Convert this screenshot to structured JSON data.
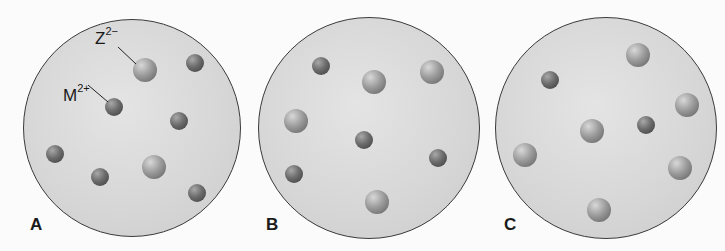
{
  "panels": [
    {
      "label": "A",
      "cx": 132,
      "cy": 128,
      "r": 109,
      "particles": [
        {
          "type": "Z2-",
          "x": 145,
          "y": 70
        },
        {
          "type": "M2+",
          "x": 195,
          "y": 63
        },
        {
          "type": "M2+",
          "x": 114,
          "y": 107
        },
        {
          "type": "M2+",
          "x": 179,
          "y": 121
        },
        {
          "type": "M2+",
          "x": 55,
          "y": 154
        },
        {
          "type": "M2+",
          "x": 100,
          "y": 177
        },
        {
          "type": "Z2-",
          "x": 154,
          "y": 167
        },
        {
          "type": "M2+",
          "x": 197,
          "y": 193
        }
      ]
    },
    {
      "label": "B",
      "cx": 369,
      "cy": 128,
      "r": 111,
      "particles": [
        {
          "type": "M2+",
          "x": 321,
          "y": 66
        },
        {
          "type": "Z2-",
          "x": 374,
          "y": 82
        },
        {
          "type": "Z2-",
          "x": 432,
          "y": 72
        },
        {
          "type": "Z2-",
          "x": 296,
          "y": 121
        },
        {
          "type": "M2+",
          "x": 364,
          "y": 140
        },
        {
          "type": "M2+",
          "x": 438,
          "y": 158
        },
        {
          "type": "M2+",
          "x": 294,
          "y": 174
        },
        {
          "type": "Z2-",
          "x": 377,
          "y": 202
        }
      ]
    },
    {
      "label": "C",
      "cx": 606,
      "cy": 128,
      "r": 111,
      "particles": [
        {
          "type": "Z2-",
          "x": 638,
          "y": 55
        },
        {
          "type": "M2+",
          "x": 550,
          "y": 80
        },
        {
          "type": "Z2-",
          "x": 687,
          "y": 105
        },
        {
          "type": "Z2-",
          "x": 592,
          "y": 131
        },
        {
          "type": "M2+",
          "x": 646,
          "y": 125
        },
        {
          "type": "Z2-",
          "x": 525,
          "y": 155
        },
        {
          "type": "Z2-",
          "x": 680,
          "y": 168
        },
        {
          "type": "Z2-",
          "x": 599,
          "y": 210
        }
      ]
    }
  ],
  "labels": {
    "a": "A",
    "b": "B",
    "c": "C",
    "z_base": "Z",
    "z_charge": "2−",
    "m_base": "M",
    "m_charge": "2+"
  }
}
